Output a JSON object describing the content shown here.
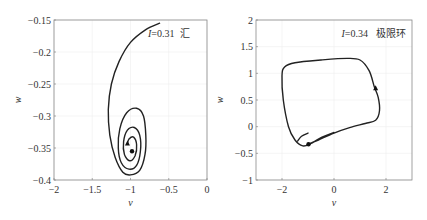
{
  "chart_data": [
    {
      "type": "line",
      "title": "",
      "annotation": {
        "italic_var": "I",
        "text": "=0.31",
        "label_cn": "汇"
      },
      "xlabel": "v",
      "ylabel": "w",
      "xlim": [
        -2,
        0
      ],
      "ylim": [
        -0.4,
        -0.15
      ],
      "xticks": [
        -2,
        -1.5,
        -1,
        -0.5,
        0
      ],
      "xtick_labels": [
        "−2",
        "−1.5",
        "−1",
        "−0.5",
        "0"
      ],
      "yticks": [
        -0.4,
        -0.35,
        -0.3,
        -0.25,
        -0.2,
        -0.15
      ],
      "ytick_labels": [
        "−0.4",
        "−0.35",
        "−0.3",
        "−0.25",
        "−0.2",
        "−0.15"
      ],
      "grid": true,
      "series": [
        {
          "name": "trajectory-sink",
          "points": [
            [
              -0.62,
              -0.155
            ],
            [
              -0.8,
              -0.165
            ],
            [
              -1.0,
              -0.185
            ],
            [
              -1.15,
              -0.215
            ],
            [
              -1.25,
              -0.25
            ],
            [
              -1.29,
              -0.29
            ],
            [
              -1.27,
              -0.33
            ],
            [
              -1.2,
              -0.365
            ],
            [
              -1.1,
              -0.388
            ],
            [
              -1.0,
              -0.392
            ],
            [
              -0.88,
              -0.385
            ],
            [
              -0.81,
              -0.36
            ],
            [
              -0.8,
              -0.33
            ],
            [
              -0.83,
              -0.3
            ],
            [
              -0.92,
              -0.288
            ],
            [
              -1.05,
              -0.295
            ],
            [
              -1.14,
              -0.32
            ],
            [
              -1.16,
              -0.35
            ],
            [
              -1.12,
              -0.373
            ],
            [
              -1.02,
              -0.383
            ],
            [
              -0.92,
              -0.377
            ],
            [
              -0.87,
              -0.355
            ],
            [
              -0.88,
              -0.33
            ],
            [
              -0.95,
              -0.318
            ],
            [
              -1.04,
              -0.322
            ],
            [
              -1.09,
              -0.34
            ],
            [
              -1.08,
              -0.36
            ],
            [
              -1.01,
              -0.37
            ],
            [
              -0.94,
              -0.362
            ],
            [
              -0.92,
              -0.345
            ],
            [
              -0.96,
              -0.333
            ],
            [
              -1.02,
              -0.336
            ],
            [
              -1.04,
              -0.343
            ]
          ]
        }
      ],
      "markers": [
        {
          "name": "start-point",
          "v": -1.04,
          "w": -0.343,
          "shape": "triangle"
        },
        {
          "name": "equilibrium-point",
          "v": -0.98,
          "w": -0.355,
          "shape": "dot"
        }
      ]
    },
    {
      "type": "line",
      "title": "",
      "annotation": {
        "italic_var": "I",
        "text": "=0.34",
        "label_cn": "极限环"
      },
      "xlabel": "v",
      "ylabel": "w",
      "xlim": [
        -3,
        3
      ],
      "ylim": [
        -1,
        2
      ],
      "xticks": [
        -2,
        0,
        2
      ],
      "xtick_labels": [
        "−2",
        "0",
        "2"
      ],
      "yticks": [
        -1,
        -0.5,
        0,
        0.5,
        1,
        1.5,
        2
      ],
      "ytick_labels": [
        "−1",
        "−0.5",
        "0",
        "0.5",
        "1",
        "1.5",
        "2"
      ],
      "grid": true,
      "series": [
        {
          "name": "trajectory-limit-cycle",
          "points": [
            [
              -1.0,
              -0.33
            ],
            [
              -0.6,
              -0.25
            ],
            [
              0.0,
              -0.12
            ],
            [
              0.6,
              -0.02
            ],
            [
              1.2,
              0.06
            ],
            [
              1.6,
              0.12
            ],
            [
              1.75,
              0.3
            ],
            [
              1.7,
              0.55
            ],
            [
              1.55,
              0.75
            ],
            [
              1.35,
              1.05
            ],
            [
              1.0,
              1.25
            ],
            [
              0.5,
              1.28
            ],
            [
              -0.5,
              1.25
            ],
            [
              -1.5,
              1.2
            ],
            [
              -1.9,
              1.12
            ],
            [
              -2.0,
              0.95
            ],
            [
              -1.95,
              0.5
            ],
            [
              -1.75,
              0.0
            ],
            [
              -1.5,
              -0.25
            ],
            [
              -1.2,
              -0.36
            ],
            [
              -0.9,
              -0.32
            ],
            [
              -0.55,
              -0.22
            ],
            [
              0.0,
              -0.11
            ]
          ]
        },
        {
          "name": "initial-transient",
          "points": [
            [
              -1.0,
              -0.12
            ],
            [
              -1.25,
              -0.18
            ],
            [
              -1.4,
              -0.27
            ]
          ]
        }
      ],
      "markers": [
        {
          "name": "start-point",
          "v": -0.98,
          "w": -0.33,
          "shape": "dot"
        },
        {
          "name": "direction-arrow",
          "v": 1.6,
          "w": 0.72,
          "shape": "triangle"
        }
      ]
    }
  ]
}
